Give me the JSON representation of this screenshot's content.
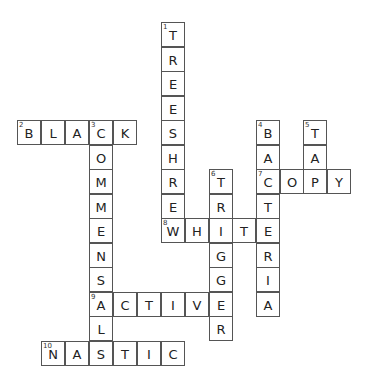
{
  "puzzle": {
    "type": "crossword",
    "cell_size": [
      24,
      25
    ],
    "cells": [
      {
        "x": 161,
        "y": 22,
        "ch": "T",
        "num": "1"
      },
      {
        "x": 161,
        "y": 47,
        "ch": "R"
      },
      {
        "x": 161,
        "y": 71,
        "ch": "E"
      },
      {
        "x": 161,
        "y": 96,
        "ch": "E"
      },
      {
        "x": 161,
        "y": 120,
        "ch": "S"
      },
      {
        "x": 161,
        "y": 145,
        "ch": "H"
      },
      {
        "x": 161,
        "y": 169,
        "ch": "R"
      },
      {
        "x": 161,
        "y": 194,
        "ch": "E"
      },
      {
        "x": 161,
        "y": 218,
        "ch": "W",
        "num": "8"
      },
      {
        "x": 185,
        "y": 218,
        "ch": "H"
      },
      {
        "x": 209,
        "y": 218,
        "ch": "I"
      },
      {
        "x": 232,
        "y": 218,
        "ch": "T"
      },
      {
        "x": 256,
        "y": 218,
        "ch": "E"
      },
      {
        "x": 17,
        "y": 120,
        "ch": "B",
        "num": "2"
      },
      {
        "x": 41,
        "y": 120,
        "ch": "L"
      },
      {
        "x": 65,
        "y": 120,
        "ch": "A"
      },
      {
        "x": 89,
        "y": 120,
        "ch": "C",
        "num": "3"
      },
      {
        "x": 113,
        "y": 120,
        "ch": "K"
      },
      {
        "x": 89,
        "y": 145,
        "ch": "O"
      },
      {
        "x": 89,
        "y": 169,
        "ch": "M"
      },
      {
        "x": 89,
        "y": 194,
        "ch": "M"
      },
      {
        "x": 89,
        "y": 218,
        "ch": "E"
      },
      {
        "x": 89,
        "y": 243,
        "ch": "N"
      },
      {
        "x": 89,
        "y": 267,
        "ch": "S"
      },
      {
        "x": 89,
        "y": 292,
        "ch": "A",
        "num": "9"
      },
      {
        "x": 89,
        "y": 316,
        "ch": "L"
      },
      {
        "x": 89,
        "y": 341,
        "ch": "S"
      },
      {
        "x": 113,
        "y": 292,
        "ch": "C"
      },
      {
        "x": 137,
        "y": 292,
        "ch": "T"
      },
      {
        "x": 161,
        "y": 292,
        "ch": "I"
      },
      {
        "x": 185,
        "y": 292,
        "ch": "V"
      },
      {
        "x": 209,
        "y": 169,
        "ch": "T",
        "num": "6"
      },
      {
        "x": 209,
        "y": 194,
        "ch": "R"
      },
      {
        "x": 209,
        "y": 243,
        "ch": "G"
      },
      {
        "x": 209,
        "y": 267,
        "ch": "G"
      },
      {
        "x": 209,
        "y": 292,
        "ch": "E"
      },
      {
        "x": 209,
        "y": 316,
        "ch": "R"
      },
      {
        "x": 256,
        "y": 120,
        "ch": "B",
        "num": "4"
      },
      {
        "x": 256,
        "y": 145,
        "ch": "A"
      },
      {
        "x": 256,
        "y": 169,
        "ch": "C",
        "num": "7"
      },
      {
        "x": 256,
        "y": 194,
        "ch": "T"
      },
      {
        "x": 256,
        "y": 243,
        "ch": "R"
      },
      {
        "x": 256,
        "y": 267,
        "ch": "I"
      },
      {
        "x": 256,
        "y": 292,
        "ch": "A"
      },
      {
        "x": 280,
        "y": 169,
        "ch": "O"
      },
      {
        "x": 303,
        "y": 120,
        "ch": "T",
        "num": "5"
      },
      {
        "x": 303,
        "y": 145,
        "ch": "A"
      },
      {
        "x": 303,
        "y": 169,
        "ch": "P"
      },
      {
        "x": 327,
        "y": 169,
        "ch": "Y"
      },
      {
        "x": 41,
        "y": 341,
        "ch": "N",
        "num": "10"
      },
      {
        "x": 65,
        "y": 341,
        "ch": "A"
      },
      {
        "x": 113,
        "y": 341,
        "ch": "T"
      },
      {
        "x": 137,
        "y": 341,
        "ch": "I"
      },
      {
        "x": 161,
        "y": 341,
        "ch": "C"
      }
    ],
    "words": {
      "across": [
        {
          "num": "2",
          "answer": "BLACK"
        },
        {
          "num": "7",
          "answer": "COPY"
        },
        {
          "num": "8",
          "answer": "WHITE"
        },
        {
          "num": "9",
          "answer": "ACTIVE"
        },
        {
          "num": "10",
          "answer": "NASTIC"
        }
      ],
      "down": [
        {
          "num": "1",
          "answer": "TREESHREW"
        },
        {
          "num": "3",
          "answer": "COMMENSALS"
        },
        {
          "num": "4",
          "answer": "BACTERIA"
        },
        {
          "num": "5",
          "answer": "TAP"
        },
        {
          "num": "6",
          "answer": "TRIGGER"
        }
      ]
    }
  }
}
